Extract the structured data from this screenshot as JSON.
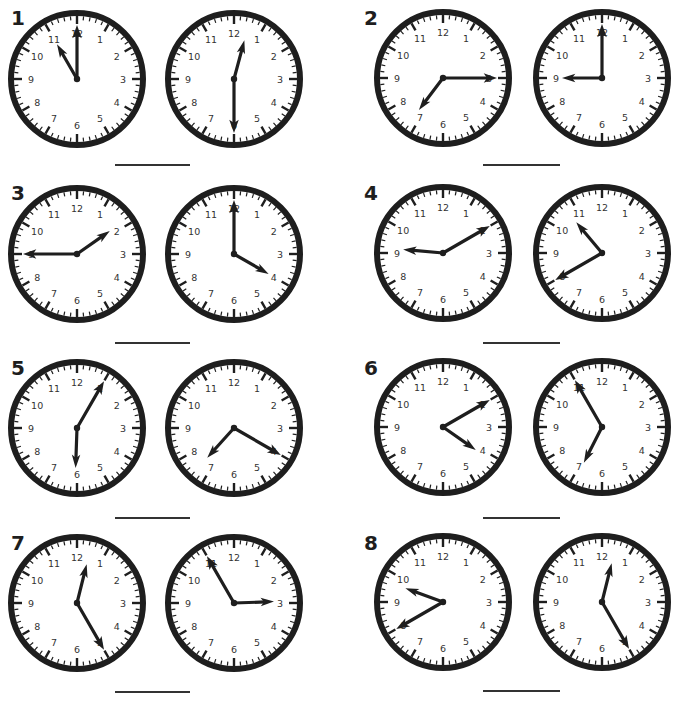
{
  "worksheet": {
    "clock_numbers": [
      "12",
      "1",
      "2",
      "3",
      "4",
      "5",
      "6",
      "7",
      "8",
      "9",
      "10",
      "11"
    ],
    "colors": {
      "ink": "#1e1e1e",
      "face": "#ffffff",
      "line": "#333333"
    },
    "questions": [
      {
        "number": "1",
        "label_pos": [
          11,
          24
        ],
        "line": [
          115,
          190,
          164
        ],
        "clocks": [
          {
            "cx": 77,
            "cy": 79,
            "time": "11:00",
            "hour_deg": 330,
            "minute_deg": 0
          },
          {
            "cx": 234,
            "cy": 79,
            "time": "12:30",
            "hour_deg": 15,
            "minute_deg": 180
          }
        ]
      },
      {
        "number": "2",
        "label_pos": [
          364,
          24
        ],
        "line": [
          483,
          560,
          164
        ],
        "clocks": [
          {
            "cx": 443,
            "cy": 78,
            "time": "7:15",
            "hour_deg": 217,
            "minute_deg": 90
          },
          {
            "cx": 602,
            "cy": 78,
            "time": "9:00",
            "hour_deg": 270,
            "minute_deg": 0
          }
        ]
      },
      {
        "number": "3",
        "label_pos": [
          11,
          199
        ],
        "line": [
          115,
          190,
          342
        ],
        "clocks": [
          {
            "cx": 77,
            "cy": 254,
            "time": "1:45",
            "hour_deg": 55,
            "minute_deg": 270
          },
          {
            "cx": 234,
            "cy": 254,
            "time": "4:00",
            "hour_deg": 120,
            "minute_deg": 0
          }
        ]
      },
      {
        "number": "4",
        "label_pos": [
          364,
          199
        ],
        "line": [
          483,
          560,
          342
        ],
        "clocks": [
          {
            "cx": 443,
            "cy": 253,
            "time": "9:10",
            "hour_deg": 275,
            "minute_deg": 60
          },
          {
            "cx": 602,
            "cy": 253,
            "time": "10:40",
            "hour_deg": 320,
            "minute_deg": 240
          }
        ]
      },
      {
        "number": "5",
        "label_pos": [
          11,
          374
        ],
        "line": [
          115,
          190,
          517
        ],
        "clocks": [
          {
            "cx": 77,
            "cy": 428,
            "time": "6:05",
            "hour_deg": 182,
            "minute_deg": 30
          },
          {
            "cx": 234,
            "cy": 428,
            "time": "7:20",
            "hour_deg": 222,
            "minute_deg": 120
          }
        ]
      },
      {
        "number": "6",
        "label_pos": [
          364,
          374
        ],
        "line": [
          483,
          560,
          517
        ],
        "clocks": [
          {
            "cx": 443,
            "cy": 427,
            "time": "4:10",
            "hour_deg": 125,
            "minute_deg": 60
          },
          {
            "cx": 602,
            "cy": 427,
            "time": "6:55",
            "hour_deg": 207,
            "minute_deg": 330
          }
        ]
      },
      {
        "number": "7",
        "label_pos": [
          11,
          549
        ],
        "line": [
          115,
          190,
          691
        ],
        "clocks": [
          {
            "cx": 77,
            "cy": 603,
            "time": "12:25",
            "hour_deg": 14,
            "minute_deg": 150
          },
          {
            "cx": 234,
            "cy": 603,
            "time": "2:55",
            "hour_deg": 88,
            "minute_deg": 330
          }
        ]
      },
      {
        "number": "8",
        "label_pos": [
          364,
          549
        ],
        "line": [
          483,
          560,
          690
        ],
        "clocks": [
          {
            "cx": 443,
            "cy": 602,
            "time": "9:40",
            "hour_deg": 290,
            "minute_deg": 240
          },
          {
            "cx": 602,
            "cy": 602,
            "time": "12:25",
            "hour_deg": 14,
            "minute_deg": 150
          }
        ]
      }
    ]
  }
}
